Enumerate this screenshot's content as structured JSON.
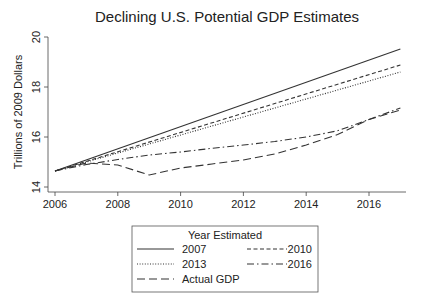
{
  "chart_data": {
    "type": "line",
    "title": "Declining U.S. Potential GDP Estimates",
    "xlabel": "",
    "ylabel": "Trillions of 2009 Dollars",
    "xlim": [
      2006,
      2017
    ],
    "ylim": [
      14,
      20
    ],
    "x_ticks": [
      2006,
      2008,
      2010,
      2012,
      2014,
      2016
    ],
    "y_ticks": [
      14,
      16,
      18,
      20
    ],
    "grid": false,
    "legend": {
      "title": "Year Estimated",
      "position": "bottom",
      "entries": [
        "2007",
        "2010",
        "2013",
        "2016",
        "Actual GDP"
      ]
    },
    "series": [
      {
        "name": "2007",
        "style": "solid",
        "x": [
          2006,
          2017
        ],
        "values": [
          14.64,
          19.52
        ]
      },
      {
        "name": "2010",
        "style": "dashed",
        "x": [
          2006,
          2017
        ],
        "values": [
          14.64,
          18.88
        ]
      },
      {
        "name": "2013",
        "style": "dotted",
        "x": [
          2006,
          2017
        ],
        "values": [
          14.64,
          18.6
        ]
      },
      {
        "name": "2016",
        "style": "dash-dot",
        "x": [
          2006,
          2007,
          2008,
          2009,
          2010,
          2011,
          2012,
          2013,
          2014,
          2015,
          2016,
          2017
        ],
        "values": [
          14.64,
          14.9,
          15.1,
          15.28,
          15.4,
          15.55,
          15.68,
          15.82,
          16.0,
          16.25,
          16.7,
          17.16
        ]
      },
      {
        "name": "Actual GDP",
        "style": "long-dash",
        "x": [
          2006,
          2007,
          2008,
          2009,
          2010,
          2011,
          2012,
          2013,
          2014,
          2015,
          2016,
          2017
        ],
        "values": [
          14.64,
          14.96,
          14.88,
          14.48,
          14.76,
          14.92,
          15.08,
          15.32,
          15.68,
          16.1,
          16.7,
          17.08
        ]
      }
    ]
  }
}
